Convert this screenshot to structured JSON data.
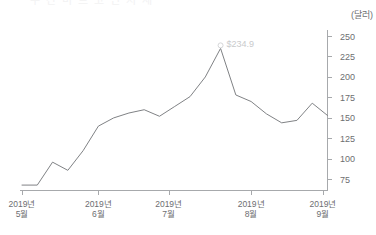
{
  "title_cropped": "주 간 비 트 코 인 시 세",
  "unit_label": "(달러)",
  "annotation": {
    "label": "$234.9",
    "x_index": 13,
    "value": 234.9
  },
  "chart_data": {
    "type": "line",
    "title": "",
    "xlabel": "",
    "ylabel": "(달러)",
    "ylim": [
      62,
      250
    ],
    "yticks": [
      75,
      100,
      125,
      150,
      175,
      200,
      225,
      250
    ],
    "ytick_labels": [
      "75",
      "100",
      "125",
      "150",
      "175",
      "200",
      "225",
      "250"
    ],
    "grid": false,
    "legend": "none",
    "axis_position": "right",
    "xtick_labels": [
      "2019년\n5월",
      "2019년\n6월",
      "2019년\n7월",
      "2019년\n8월",
      "2019년\n9월"
    ],
    "xticks_major": [
      {
        "line1": "2019년",
        "line2": "5월",
        "index": 0
      },
      {
        "line1": "2019년",
        "line2": "6월",
        "index": 5
      },
      {
        "line1": "2019년",
        "line2": "7월",
        "index": 9.6
      },
      {
        "line1": "2019년",
        "line2": "8월",
        "index": 15
      },
      {
        "line1": "2019년",
        "line2": "9월",
        "index": 19.7
      }
    ],
    "series": [
      {
        "name": "비트코인 시세",
        "color": "#808285",
        "values": [
          68,
          68,
          96,
          86,
          110,
          140,
          150,
          156,
          160,
          152,
          164,
          176,
          200,
          234.9,
          178,
          170,
          155,
          144,
          147,
          168,
          153
        ]
      }
    ]
  }
}
